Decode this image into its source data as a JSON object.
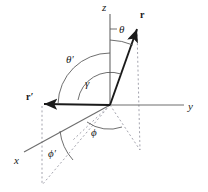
{
  "figure": {
    "background_color": "#ffffff",
    "axis_color": "#6e6e6e",
    "vector_color": "#1a1a1a",
    "arc_color": "#555555",
    "dash_color": "#9a9aa5",
    "label_color": "#1a1a1a",
    "width": 208,
    "height": 192
  },
  "axes": [
    {
      "name": "z-axis",
      "label": "z",
      "label_x": 102,
      "label_y": 2
    },
    {
      "name": "y-axis",
      "label": "y",
      "label_x": 188,
      "label_y": 101
    },
    {
      "name": "x-axis",
      "label": "x",
      "label_x": 14,
      "label_y": 155
    }
  ],
  "vectors": [
    {
      "name": "r",
      "label": "r",
      "label_x": 140,
      "label_y": 10
    },
    {
      "name": "r-prime",
      "label": "r",
      "prime": "′",
      "label_x": 26,
      "label_y": 92
    }
  ],
  "angles": [
    {
      "name": "theta",
      "label": "θ",
      "prime": "",
      "label_x": 119,
      "label_y": 24
    },
    {
      "name": "theta-prime",
      "label": "θ",
      "prime": "′",
      "label_x": 66,
      "label_y": 54
    },
    {
      "name": "gamma",
      "label": "γ",
      "prime": "",
      "label_x": 85,
      "label_y": 78
    },
    {
      "name": "phi",
      "label": "ϕ",
      "prime": "",
      "label_x": 91,
      "label_y": 127
    },
    {
      "name": "phi-prime",
      "label": "ϕ",
      "prime": "′",
      "label_x": 48,
      "label_y": 148
    }
  ],
  "geometry": {
    "origin": {
      "x": 110,
      "y": 105
    },
    "z_axis_top": {
      "x": 110,
      "y": 14
    },
    "y_axis_end": {
      "x": 184,
      "y": 105
    },
    "x_axis_end": {
      "x": 24,
      "y": 152
    },
    "r_tip": {
      "x": 137,
      "y": 27
    },
    "r_prime_tip": {
      "x": 42,
      "y": 104
    },
    "r_foot": {
      "x": 140,
      "y": 150
    },
    "r_prime_foot": {
      "x": 42,
      "y": 185
    }
  }
}
